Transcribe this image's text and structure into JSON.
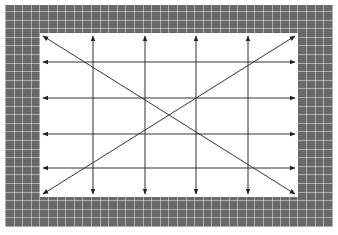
{
  "diagram": {
    "colors": {
      "frame": "#6e6e6e",
      "frame_grid": "#b8b8b8",
      "panel": "#ffffff",
      "line": "#333333"
    },
    "panel": {
      "x": 40,
      "y": 33,
      "width": 258,
      "height": 164
    },
    "vertical_lines": [
      {
        "x": 93,
        "arrow": "both"
      },
      {
        "x": 145,
        "arrow": "both"
      },
      {
        "x": 196,
        "arrow": "both"
      },
      {
        "x": 248,
        "arrow": "both"
      }
    ],
    "horizontal_lines": [
      {
        "y": 62,
        "arrow": "both"
      },
      {
        "y": 98,
        "arrow": "both"
      },
      {
        "y": 134,
        "arrow": "both"
      },
      {
        "y": 168,
        "arrow": "both"
      }
    ],
    "diagonals": [
      {
        "from": "top-left",
        "to": "bottom-right",
        "arrow": "both"
      },
      {
        "from": "bottom-left",
        "to": "top-right",
        "arrow": "both"
      }
    ]
  }
}
